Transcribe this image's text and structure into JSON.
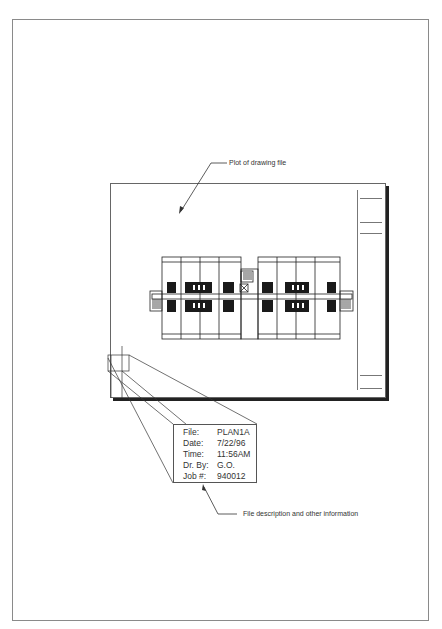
{
  "callouts": {
    "plot_label": "Plot of drawing file",
    "info_label": "File description and other information"
  },
  "file_info": {
    "rows": [
      {
        "key": "File:",
        "value": "PLAN1A"
      },
      {
        "key": "Date:",
        "value": "7/22/96"
      },
      {
        "key": "Time:",
        "value": "11:56AM"
      },
      {
        "key": "Dr. By:",
        "value": "G.O."
      },
      {
        "key": "Job #:",
        "value": "940012"
      }
    ]
  },
  "drawing": {
    "units_left": 4,
    "units_right": 4,
    "title_strip_rules": 5
  },
  "colors": {
    "line": "#222222",
    "frame": "#666666",
    "page_border": "#8a8a8a"
  }
}
